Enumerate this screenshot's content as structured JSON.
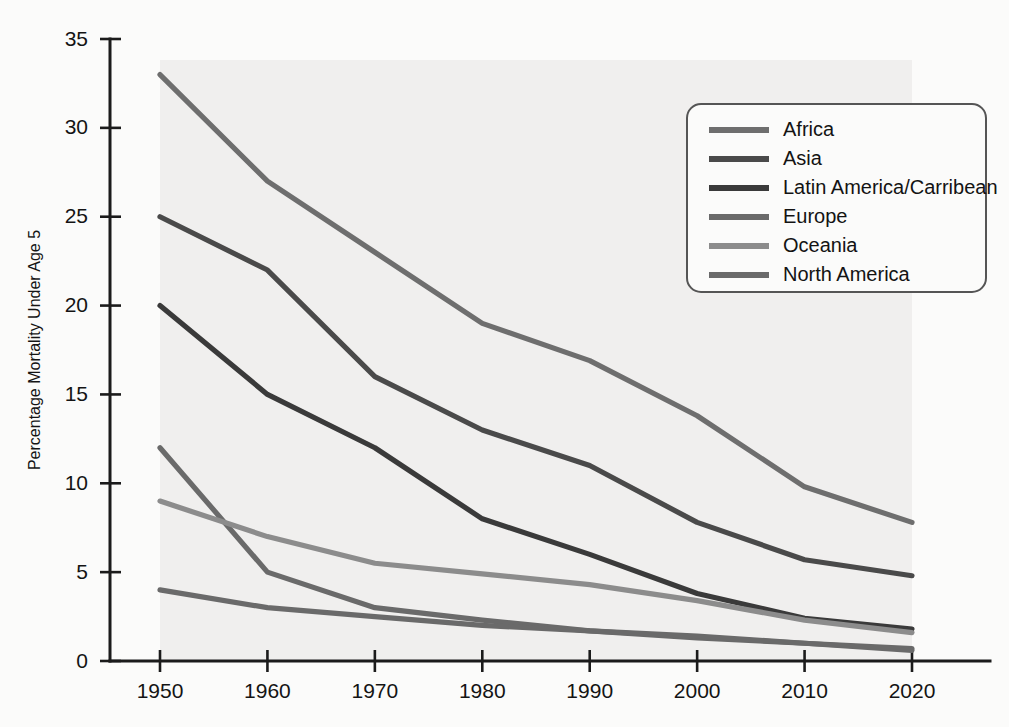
{
  "chart_data": {
    "type": "line",
    "title": "",
    "xlabel": "",
    "ylabel": "Percentage Mortality Under Age 5",
    "x": [
      1950,
      1960,
      1970,
      1980,
      1990,
      2000,
      2010,
      2020
    ],
    "xtick_labels": [
      "1950",
      "1960",
      "1970",
      "1980",
      "1990",
      "2000",
      "2010",
      "2020"
    ],
    "ytick_labels": [
      "0",
      "5",
      "10",
      "15",
      "20",
      "25",
      "30",
      "35"
    ],
    "ytick_values": [
      0,
      5,
      10,
      15,
      20,
      25,
      30,
      35
    ],
    "xlim": [
      1950,
      2020
    ],
    "ylim": [
      0,
      35
    ],
    "grid": false,
    "legend_position": "upper-right",
    "series": [
      {
        "name": "Africa",
        "color": "#6e6e6e",
        "values": [
          33.0,
          27.0,
          23.0,
          19.0,
          16.9,
          13.8,
          9.8,
          7.8
        ]
      },
      {
        "name": "Asia",
        "color": "#4a4a4a",
        "values": [
          25.0,
          22.0,
          16.0,
          13.0,
          11.0,
          7.8,
          5.7,
          4.8
        ]
      },
      {
        "name": "Latin America/Carribean",
        "color": "#3a3a3a",
        "values": [
          20.0,
          15.0,
          12.0,
          8.0,
          6.0,
          3.8,
          2.4,
          1.8
        ]
      },
      {
        "name": "Europe",
        "color": "#6a6a6a",
        "values": [
          12.0,
          5.0,
          3.0,
          2.3,
          1.7,
          1.3,
          1.0,
          0.7
        ]
      },
      {
        "name": "Oceania",
        "color": "#8c8c8c",
        "values": [
          9.0,
          7.0,
          5.5,
          4.9,
          4.3,
          3.4,
          2.3,
          1.6
        ]
      },
      {
        "name": "North America",
        "color": "#6a6a6a",
        "values": [
          4.0,
          3.0,
          2.5,
          2.0,
          1.7,
          1.4,
          1.0,
          0.6
        ]
      }
    ]
  },
  "legend": {
    "items": [
      {
        "label": "Africa"
      },
      {
        "label": "Asia"
      },
      {
        "label": "Latin America/Carribean"
      },
      {
        "label": "Europe"
      },
      {
        "label": "Oceania"
      },
      {
        "label": "North America"
      }
    ]
  }
}
